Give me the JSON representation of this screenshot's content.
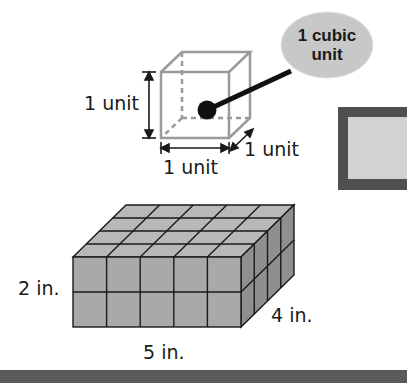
{
  "unit_cube": {
    "callout": {
      "line1": "1 cubic",
      "line2": "unit"
    },
    "height_label": "1 unit",
    "width_label": "1 unit",
    "depth_label": "1 unit"
  },
  "prism": {
    "height_label": "2 in.",
    "depth_label": "4 in.",
    "length_label": "5 in.",
    "length_cubes": 5,
    "depth_cubes": 4,
    "height_cubes": 2
  },
  "colors": {
    "cube_edge": "#9a9a9a",
    "bubble_fill": "#c8c8c8",
    "prism_front": "#a9a9a9",
    "prism_top": "#b8b8b8",
    "prism_side": "#8f8f8f",
    "frame_dark": "#4f4f4f",
    "frame_inner": "#d2d2d2"
  }
}
